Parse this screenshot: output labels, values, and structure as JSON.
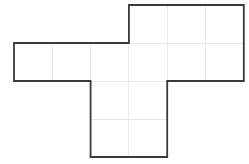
{
  "figure": {
    "background_color": "#ffffff",
    "outline_color": "#3a3a3a",
    "outline_width": 1.8,
    "grid_color": "#e9e9e9",
    "grid_width": 1,
    "canvas": {
      "width": 249,
      "height": 164
    },
    "grid": {
      "x_positions": [
        14,
        52.3,
        90.6,
        128.9,
        167.2,
        205.5,
        243.8
      ],
      "y_positions": [
        5,
        43,
        81,
        119,
        157
      ],
      "cell_width": 38.3,
      "cell_height": 38,
      "columns": 6,
      "rows": 4
    },
    "cells": [
      {
        "col": 3,
        "row": 0
      },
      {
        "col": 4,
        "row": 0
      },
      {
        "col": 5,
        "row": 0
      },
      {
        "col": 0,
        "row": 1
      },
      {
        "col": 1,
        "row": 1
      },
      {
        "col": 2,
        "row": 1
      },
      {
        "col": 3,
        "row": 1
      },
      {
        "col": 4,
        "row": 1
      },
      {
        "col": 5,
        "row": 1
      },
      {
        "col": 2,
        "row": 2
      },
      {
        "col": 3,
        "row": 2
      },
      {
        "col": 2,
        "row": 3
      },
      {
        "col": 3,
        "row": 3
      }
    ],
    "cell_count": 13,
    "interior_grid_segments": [
      {
        "orientation": "vertical",
        "x": 52.3,
        "y1": 43,
        "y2": 81
      },
      {
        "orientation": "vertical",
        "x": 90.6,
        "y1": 43,
        "y2": 81
      },
      {
        "orientation": "vertical",
        "x": 128.9,
        "y1": 5,
        "y2": 157
      },
      {
        "orientation": "vertical",
        "x": 167.2,
        "y1": 5,
        "y2": 81
      },
      {
        "orientation": "vertical",
        "x": 205.5,
        "y1": 5,
        "y2": 81
      },
      {
        "orientation": "horizontal",
        "y": 43,
        "x1": 128.9,
        "x2": 243.8
      },
      {
        "orientation": "horizontal",
        "y": 81,
        "x1": 14,
        "x2": 243.8
      },
      {
        "orientation": "horizontal",
        "y": 119,
        "x1": 90.6,
        "x2": 167.2
      }
    ],
    "outline_points": [
      [
        128.9,
        5
      ],
      [
        243.8,
        5
      ],
      [
        243.8,
        81
      ],
      [
        167.2,
        81
      ],
      [
        167.2,
        157
      ],
      [
        90.6,
        157
      ],
      [
        90.6,
        81
      ],
      [
        14,
        81
      ],
      [
        14,
        43
      ],
      [
        128.9,
        43
      ]
    ]
  }
}
